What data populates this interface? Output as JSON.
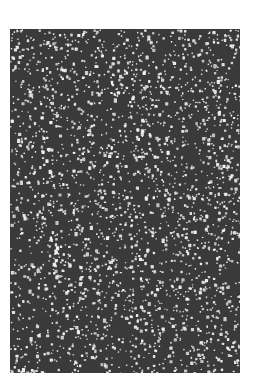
{
  "image": {
    "description": "Random speckle noise texture",
    "panel": {
      "x": 10,
      "y": 29,
      "width": 230,
      "height": 344
    },
    "colors": {
      "page_background": "#ffffff",
      "panel_background": "#3a3a3a",
      "speckle": "#f2f2f2"
    },
    "speckle": {
      "count": 2600,
      "seed": 1337
    }
  }
}
